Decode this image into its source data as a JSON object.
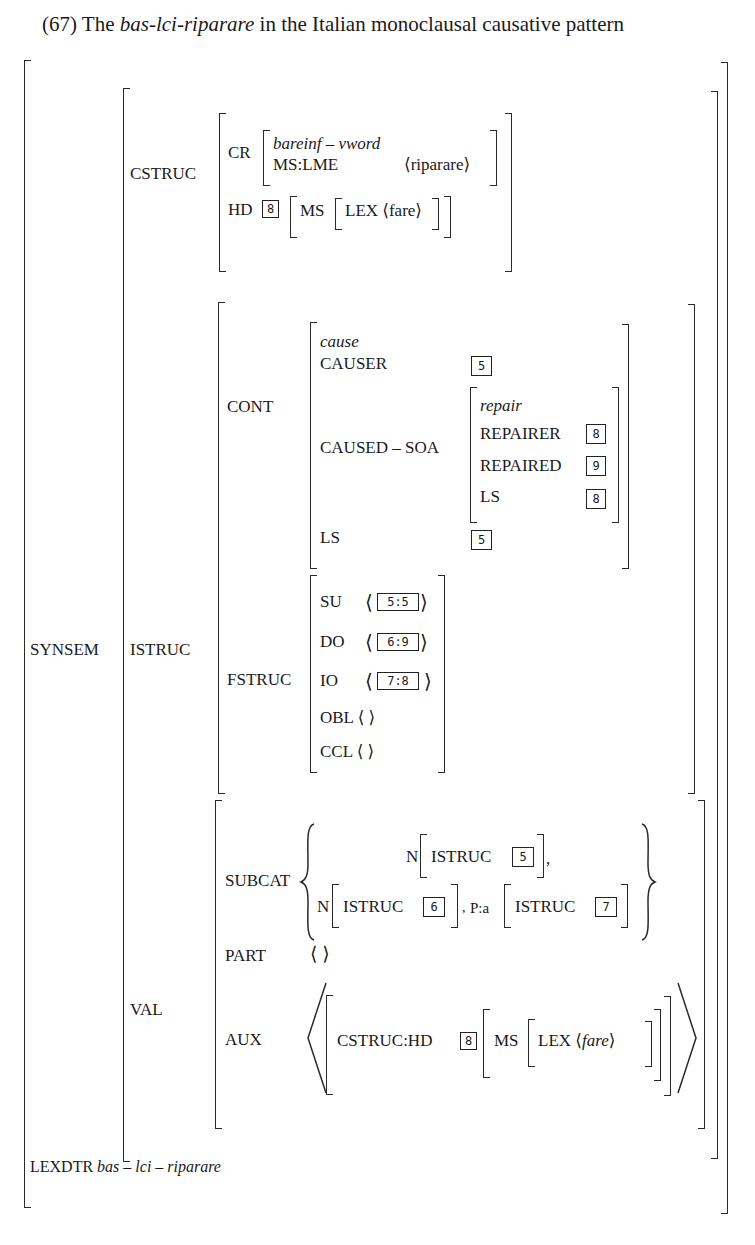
{
  "title": {
    "number": "(67) The ",
    "term": "bas-lci-riparare",
    "rest": " in the Italian monoclausal causative pattern"
  },
  "avm": {
    "synsem": {
      "label": "SYNSEM",
      "cstruc": {
        "label": "CSTRUC",
        "cr": {
          "label": "CR",
          "type": "bareinf – vword",
          "ms_lme_label": "MS:LME",
          "ms_lme_value": "riparare"
        },
        "hd": {
          "label": "HD",
          "tag": "8",
          "ms_label": "MS",
          "lex_label": "LEX",
          "lex_value": "fare"
        }
      },
      "istruc": {
        "label": "ISTRUC",
        "cont": {
          "label": "CONT",
          "type": "cause",
          "causer_label": "CAUSER",
          "causer_tag": "5",
          "caused_soa_label": "CAUSED – SOA",
          "caused_soa": {
            "type": "repair",
            "repairer_label": "REPAIRER",
            "repairer_tag": "8",
            "repaired_label": "REPAIRED",
            "repaired_tag": "9",
            "ls_label": "LS",
            "ls_tag": "8"
          },
          "ls_label": "LS",
          "ls_tag": "5"
        },
        "fstruc": {
          "label": "FSTRUC",
          "rows": [
            {
              "label": "SU",
              "value": "5:5"
            },
            {
              "label": "DO",
              "value": "6:9"
            },
            {
              "label": "IO",
              "value": "7:8"
            },
            {
              "label": "OBL",
              "value": ""
            },
            {
              "label": "CCL",
              "value": ""
            }
          ]
        }
      },
      "val": {
        "label": "VAL",
        "subcat": {
          "label": "SUBCAT",
          "item1_cat": "N",
          "item1_attr": "ISTRUC",
          "item1_tag": "5",
          "item2_cat": "N",
          "item2_attr": "ISTRUC",
          "item2_tag": "6",
          "item3_cat": "P:a",
          "item3_attr": "ISTRUC",
          "item3_tag": "7"
        },
        "part": {
          "label": "PART"
        },
        "aux": {
          "label": "AUX",
          "path": "CSTRUC:HD",
          "tag": "8",
          "ms_label": "MS",
          "lex_label": "LEX",
          "lex_value": "fare"
        }
      }
    },
    "lexdtr": {
      "label": "LEXDTR",
      "value": "bas – lci – riparare"
    }
  }
}
